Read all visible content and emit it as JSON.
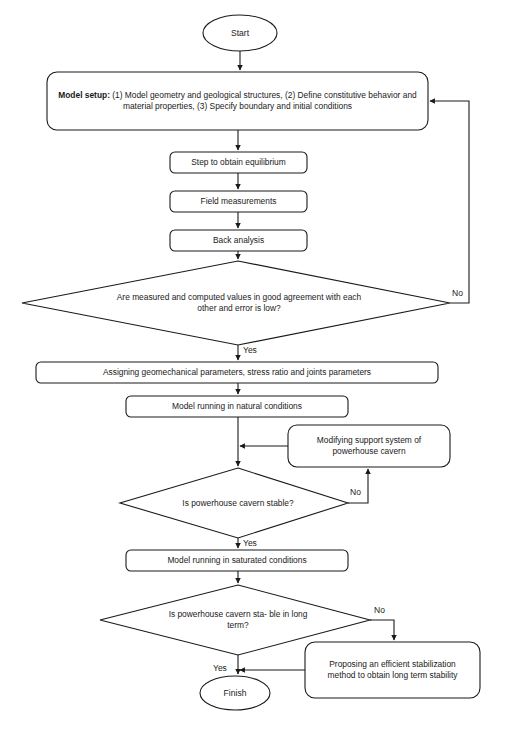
{
  "diagram": {
    "type": "flowchart",
    "line_color": "#1a1a1a",
    "text_color": "#1a1a1a",
    "background": "#ffffff"
  },
  "nodes": {
    "start": {
      "shape": "terminator",
      "label": "Start"
    },
    "model_setup": {
      "shape": "process",
      "lead_label": "Model setup:",
      "label": " (1) Model geometry and geological structures, (2) Define constitutive behavior and material properties, (3) Specify boundary and initial conditions"
    },
    "step_equilibrium": {
      "shape": "process",
      "label": "Step to obtain equilibrium"
    },
    "field_measurements": {
      "shape": "process",
      "label": "Field measurements"
    },
    "back_analysis": {
      "shape": "process",
      "label": "Back analysis"
    },
    "decision_agreement": {
      "shape": "decision",
      "label": "Are measured and computed values in good agreement with each other and error is low?"
    },
    "assigning_params": {
      "shape": "process",
      "label": "Assigning geomechanical parameters, stress ratio and joints parameters"
    },
    "model_natural": {
      "shape": "process",
      "label": "Model running in natural conditions"
    },
    "modifying_support": {
      "shape": "process",
      "label": "Modifying support system of powerhouse cavern"
    },
    "decision_stable": {
      "shape": "decision",
      "label": "Is powerhouse cavern stable?"
    },
    "model_saturated": {
      "shape": "process",
      "label": "Model running in saturated conditions"
    },
    "decision_long_term": {
      "shape": "decision",
      "label": "Is powerhouse cavern sta- ble in long term?"
    },
    "proposing_stabilization": {
      "shape": "process",
      "label": "Proposing an efficient stabilization method to obtain long term stability"
    },
    "finish": {
      "shape": "terminator",
      "label": "Finish"
    }
  },
  "edge_labels": {
    "agreement_no": "No",
    "agreement_yes": "Yes",
    "stable_no": "No",
    "stable_yes": "Yes",
    "long_term_no": "No",
    "long_term_yes": "Yes"
  }
}
